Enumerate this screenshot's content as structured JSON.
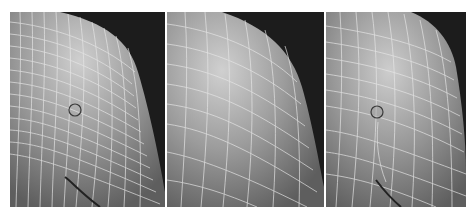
{
  "figure": {
    "background": "#ffffff",
    "panels": [
      {
        "id": "panel-1",
        "x": 10,
        "width": 155,
        "description": "dense quad mesh on curved surface with selection marker",
        "marker": {
          "cx": 65,
          "cy": 98,
          "r": 6
        },
        "mesh_density": "dense"
      },
      {
        "id": "panel-2",
        "x": 167,
        "width": 157,
        "description": "coarse quad mesh on curved surface",
        "marker": null,
        "mesh_density": "coarse"
      },
      {
        "id": "panel-3",
        "x": 326,
        "width": 140,
        "description": "medium quad mesh on curved surface with selection marker",
        "marker": {
          "cx": 51,
          "cy": 100,
          "r": 6
        },
        "mesh_density": "medium"
      }
    ],
    "colors": {
      "backdrop": "#1c1c1c",
      "surface_light": "#c8c8c8",
      "surface_mid": "#8c8c8c",
      "surface_dark": "#5a5a5a",
      "wire": "#e8e8e8",
      "marker": "#3a3a3a"
    }
  }
}
